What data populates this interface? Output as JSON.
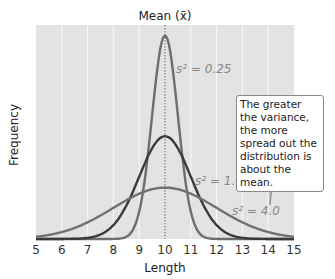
{
  "chart_data": {
    "type": "line",
    "title": "Mean (x̄)",
    "xlabel": "Length",
    "ylabel": "Frequency",
    "xlim": [
      5,
      15
    ],
    "x_ticks": [
      "5",
      "6",
      "7",
      "8",
      "9",
      "10",
      "11",
      "12",
      "13",
      "14",
      "15"
    ],
    "grid": true,
    "mean": 10,
    "series": [
      {
        "name": "s² = 0.25",
        "variance": 0.25,
        "mean": 10,
        "color": "#6e6e6e",
        "peak_height_frac": 0.95
      },
      {
        "name": "s² = 1.0",
        "variance": 1.0,
        "mean": 10,
        "color": "#3a3a3a",
        "peak_height_frac": 0.48
      },
      {
        "name": "s² = 4.0",
        "variance": 4.0,
        "mean": 10,
        "color": "#707070",
        "peak_height_frac": 0.24
      }
    ],
    "annotation": "The greater the variance, the more spread out the distribution is about the mean."
  },
  "labels": {
    "title": "Mean (x̄)",
    "xlabel": "Length",
    "ylabel": "Frequency",
    "s1": "s² = 0.25",
    "s2": "s² = 1.0",
    "s3": "s² = 4.0",
    "callout": "The greater the variance, the more spread out the distribution is about the mean."
  }
}
